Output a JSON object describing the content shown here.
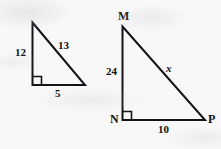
{
  "figure": {
    "background_color": "#f8f8f9",
    "stroke_color": "#141418"
  },
  "triangles": [
    {
      "id": "small-triangle",
      "name": "left-triangle",
      "vertex_labels": [],
      "right_angle_at": "bottom-left",
      "sides": [
        {
          "name": "vertical-leg",
          "label": "12"
        },
        {
          "name": "hypotenuse",
          "label": "13"
        },
        {
          "name": "horizontal-leg",
          "label": "5"
        }
      ]
    },
    {
      "id": "large-triangle",
      "name": "right-triangle-MNP",
      "vertex_labels": [
        {
          "name": "vertex-m",
          "label": "M"
        },
        {
          "name": "vertex-n",
          "label": "N"
        },
        {
          "name": "vertex-p",
          "label": "P"
        }
      ],
      "right_angle_at": "N",
      "sides": [
        {
          "name": "vertical-leg-mn",
          "label": "24"
        },
        {
          "name": "hypotenuse-mp",
          "label": "x"
        },
        {
          "name": "horizontal-leg-np",
          "label": "10"
        }
      ]
    }
  ],
  "labels": {
    "small_vertical": "12",
    "small_hypotenuse": "13",
    "small_horizontal": "5",
    "large_vertex_m": "M",
    "large_vertex_n": "N",
    "large_vertex_p": "P",
    "large_vertical": "24",
    "large_hypotenuse": "x",
    "large_horizontal": "10"
  }
}
